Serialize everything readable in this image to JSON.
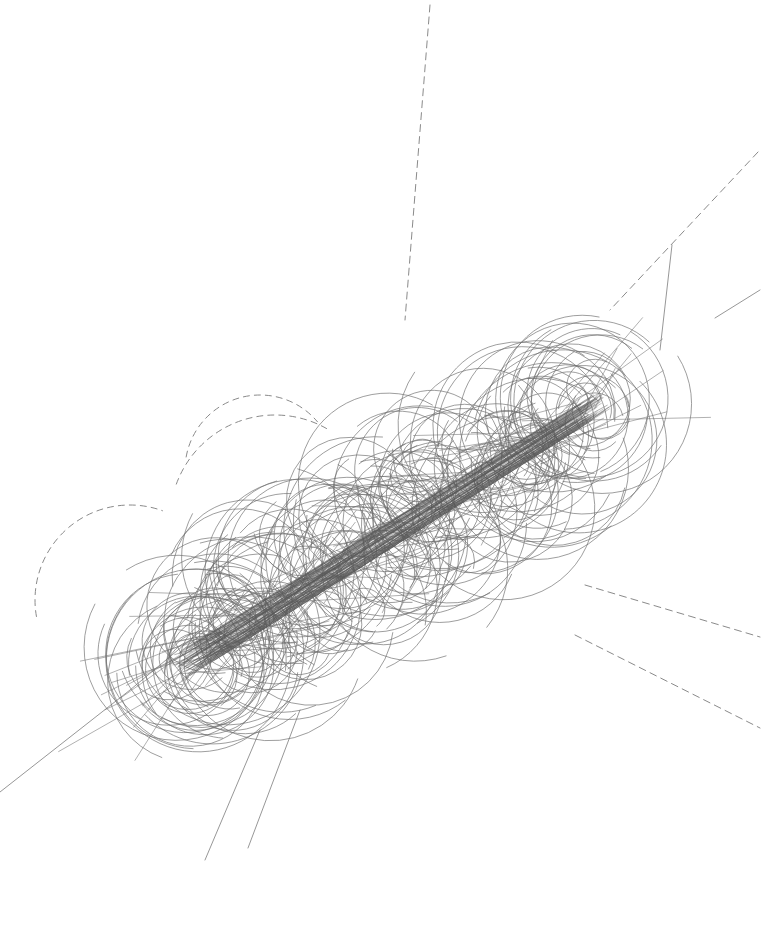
{
  "image": {
    "width": 763,
    "height": 938,
    "background": "#ffffff",
    "description": "Particle-track style visualization: dense helical/circular tracks around a diagonal beam axis"
  },
  "style": {
    "track_color": "#6e6e6e",
    "core_color": "#5a5a5a",
    "dashed_color": "#8a8a8a",
    "track_width": 0.9,
    "core_width": 1.0
  },
  "beam_axis": {
    "from": [
      175,
      670
    ],
    "to": [
      605,
      400
    ],
    "core_thickness": 26,
    "vertex": [
      385,
      535
    ]
  },
  "generator": {
    "seed": 7,
    "circle_count": 230,
    "straight_count": 160,
    "radius_min": 18,
    "radius_max": 95,
    "spread": 95
  },
  "long_tracks": [
    {
      "points": [
        [
          0,
          792
        ],
        [
          130,
          690
        ],
        [
          250,
          590
        ]
      ],
      "dashed": false
    },
    {
      "points": [
        [
          205,
          860
        ],
        [
          260,
          730
        ]
      ],
      "dashed": false
    },
    {
      "points": [
        [
          248,
          848
        ],
        [
          300,
          710
        ]
      ],
      "dashed": false
    },
    {
      "points": [
        [
          715,
          318
        ],
        [
          760,
          290
        ]
      ],
      "dashed": false
    },
    {
      "points": [
        [
          672,
          245
        ],
        [
          660,
          350
        ]
      ],
      "dashed": false
    }
  ],
  "dashed_tracks": [
    {
      "points": [
        [
          430,
          5
        ],
        [
          405,
          320
        ]
      ]
    },
    {
      "points": [
        [
          758,
          152
        ],
        [
          610,
          310
        ]
      ]
    },
    {
      "points": [
        [
          585,
          585
        ],
        [
          760,
          637
        ]
      ]
    },
    {
      "points": [
        [
          575,
          635
        ],
        [
          760,
          728
        ]
      ]
    }
  ],
  "dashed_arcs": [
    {
      "cx": 275,
      "cy": 520,
      "r": 105,
      "start": 200,
      "end": 300
    },
    {
      "cx": 130,
      "cy": 600,
      "r": 95,
      "start": 170,
      "end": 290
    },
    {
      "cx": 260,
      "cy": 470,
      "r": 75,
      "start": 190,
      "end": 320
    }
  ]
}
